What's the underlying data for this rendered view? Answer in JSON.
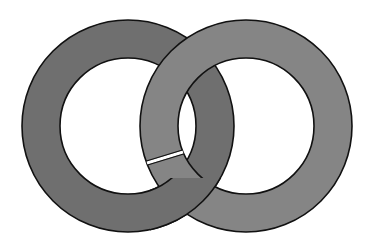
{
  "diagram": {
    "title": "",
    "background": "#ffffff",
    "outline_color": "#111111",
    "rings": [
      {
        "name": "left-ring",
        "cx": 128,
        "cy": 126,
        "outer_r": 106,
        "inner_r": 68,
        "fill": "#6f6f6f"
      },
      {
        "name": "right-ring",
        "cx": 246,
        "cy": 126,
        "outer_r": 106,
        "inner_r": 68,
        "fill": "#858585"
      }
    ],
    "gap": {
      "ring": "right-ring",
      "x1": 147,
      "y1": 163,
      "x2": 183,
      "y2": 152,
      "color": "#ffffff",
      "width": 3
    }
  }
}
